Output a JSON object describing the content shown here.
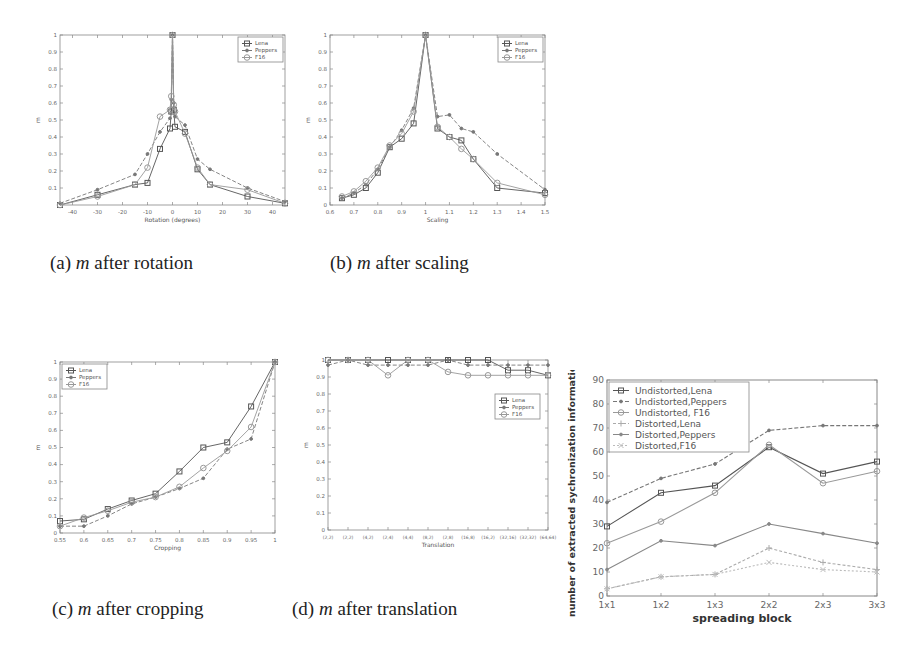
{
  "figure": {
    "captions": [
      {
        "label": "(a)",
        "var": "m",
        "text": "after rotation"
      },
      {
        "label": "(b)",
        "var": "m",
        "text": "after scaling"
      },
      {
        "label": "(c)",
        "var": "m",
        "text": "after cropping"
      },
      {
        "label": "(d)",
        "var": "m",
        "text": "after translation"
      }
    ]
  },
  "chart_data": [
    {
      "id": "rotation",
      "type": "line",
      "title": "",
      "xlabel": "Rotation (degrees)",
      "ylabel": "m",
      "xlim": [
        -45,
        45
      ],
      "ylim": [
        0,
        1
      ],
      "xticks": [
        -40,
        -30,
        -20,
        -10,
        0,
        10,
        20,
        30,
        40
      ],
      "yticks": [
        0.1,
        0.2,
        0.3,
        0.4,
        0.5,
        0.6,
        0.7,
        0.8,
        0.9,
        1
      ],
      "grid": false,
      "legend": {
        "position": "upper right",
        "entries": [
          "Lena",
          "Peppers",
          "F16"
        ]
      },
      "x": [
        -45,
        -30,
        -15,
        -10,
        -5,
        -1,
        -0.5,
        0,
        0.5,
        1,
        5,
        10,
        15,
        30,
        45
      ],
      "series": [
        {
          "name": "Lena",
          "marker": "square",
          "values": [
            0.0,
            0.06,
            0.12,
            0.13,
            0.33,
            0.45,
            0.55,
            1.0,
            0.56,
            0.46,
            0.43,
            0.21,
            0.12,
            0.05,
            0.01
          ]
        },
        {
          "name": "Peppers",
          "marker": "dot",
          "values": [
            0.01,
            0.09,
            0.18,
            0.3,
            0.43,
            0.51,
            0.62,
            1.0,
            0.6,
            0.52,
            0.47,
            0.27,
            0.21,
            0.1,
            0.02
          ]
        },
        {
          "name": "F16",
          "marker": "circle",
          "values": [
            0.0,
            0.05,
            0.12,
            0.22,
            0.52,
            0.56,
            0.64,
            1.0,
            0.59,
            0.55,
            0.42,
            0.22,
            0.12,
            0.09,
            0.01
          ]
        }
      ]
    },
    {
      "id": "scaling",
      "type": "line",
      "title": "",
      "xlabel": "Scaling",
      "ylabel": "m",
      "xlim": [
        0.6,
        1.5
      ],
      "ylim": [
        0,
        1
      ],
      "xticks": [
        0.6,
        0.7,
        0.8,
        0.9,
        1,
        1.1,
        1.2,
        1.3,
        1.4,
        1.5
      ],
      "xticklabels": [
        "0.6",
        "0.7",
        "0.8",
        "0.9",
        "1",
        "1.1",
        "1.2",
        "1.3",
        "1.4",
        "1.5"
      ],
      "yticks": [
        0,
        0.1,
        0.2,
        0.3,
        0.4,
        0.5,
        0.6,
        0.7,
        0.8,
        0.9,
        1
      ],
      "grid": false,
      "legend": {
        "position": "upper right",
        "entries": [
          "Lena",
          "Peppers",
          "F16"
        ]
      },
      "x": [
        0.65,
        0.7,
        0.75,
        0.8,
        0.85,
        0.9,
        0.95,
        1.0,
        1.05,
        1.1,
        1.15,
        1.2,
        1.3,
        1.5
      ],
      "series": [
        {
          "name": "Lena",
          "marker": "square",
          "values": [
            0.04,
            0.06,
            0.1,
            0.19,
            0.34,
            0.39,
            0.48,
            1.0,
            0.45,
            0.4,
            0.38,
            0.27,
            0.1,
            0.07
          ]
        },
        {
          "name": "Peppers",
          "marker": "dot",
          "values": [
            0.04,
            0.07,
            0.12,
            0.21,
            0.34,
            0.44,
            0.57,
            1.0,
            0.52,
            0.53,
            0.45,
            0.43,
            0.3,
            0.09
          ]
        },
        {
          "name": "F16",
          "marker": "circle",
          "values": [
            0.05,
            0.08,
            0.14,
            0.22,
            0.35,
            0.42,
            0.55,
            1.0,
            0.46,
            0.4,
            0.33,
            0.27,
            0.13,
            0.06
          ]
        }
      ]
    },
    {
      "id": "cropping",
      "type": "line",
      "title": "",
      "xlabel": "Cropping",
      "ylabel": "m",
      "xlim": [
        0.55,
        1
      ],
      "ylim": [
        0,
        1
      ],
      "xticks": [
        0.55,
        0.6,
        0.65,
        0.7,
        0.75,
        0.8,
        0.85,
        0.9,
        0.95,
        1
      ],
      "xticklabels": [
        "0.55",
        "0.6",
        "0.65",
        "0.7",
        "0.75",
        "0.8",
        "0.85",
        "0.9",
        "0.95",
        "1"
      ],
      "yticks": [
        0,
        0.1,
        0.2,
        0.3,
        0.4,
        0.5,
        0.6,
        0.7,
        0.8,
        0.9,
        1
      ],
      "grid": false,
      "legend": {
        "position": "upper left",
        "entries": [
          "Lena",
          "Peppers",
          "F16"
        ]
      },
      "x": [
        0.55,
        0.6,
        0.65,
        0.7,
        0.75,
        0.8,
        0.85,
        0.9,
        0.95,
        1.0
      ],
      "series": [
        {
          "name": "Lena",
          "marker": "square",
          "values": [
            0.07,
            0.08,
            0.14,
            0.19,
            0.23,
            0.36,
            0.5,
            0.53,
            0.74,
            1.0
          ]
        },
        {
          "name": "Peppers",
          "marker": "dot",
          "values": [
            0.04,
            0.04,
            0.1,
            0.17,
            0.21,
            0.26,
            0.32,
            0.49,
            0.55,
            1.0
          ]
        },
        {
          "name": "F16",
          "marker": "circle",
          "values": [
            0.04,
            0.09,
            0.13,
            0.18,
            0.21,
            0.27,
            0.38,
            0.48,
            0.62,
            1.0
          ]
        }
      ]
    },
    {
      "id": "translation",
      "type": "line",
      "title": "",
      "xlabel": "Translation",
      "ylabel": "m",
      "ylim": [
        0,
        1
      ],
      "yticks": [
        0,
        0.1,
        0.2,
        0.3,
        0.4,
        0.5,
        0.6,
        0.7,
        0.8,
        0.9,
        1
      ],
      "categories": [
        "(2,2)",
        "(2,2)",
        "(4,2)",
        "(2,4)",
        "(4,4)",
        "(8,2)",
        "(2,8)",
        "(16,8)",
        "(16,2)",
        "(32,16)",
        "(32,32)",
        "(64,64)"
      ],
      "grid": false,
      "legend": {
        "position": "upper right (inset)",
        "entries": [
          "Lena",
          "Peppers",
          "F16"
        ]
      },
      "series": [
        {
          "name": "Lena",
          "marker": "square",
          "values": [
            1.0,
            1.0,
            1.0,
            1.0,
            1.0,
            1.0,
            1.0,
            1.0,
            1.0,
            0.94,
            0.94,
            0.91
          ]
        },
        {
          "name": "Peppers",
          "marker": "dot",
          "values": [
            0.97,
            1.0,
            0.97,
            0.97,
            0.97,
            0.97,
            1.0,
            0.97,
            0.97,
            0.97,
            0.97,
            0.97
          ]
        },
        {
          "name": "F16",
          "marker": "circle",
          "values": [
            1.0,
            1.0,
            1.0,
            0.91,
            1.0,
            1.0,
            0.93,
            0.91,
            0.91,
            0.91,
            0.91,
            0.91
          ]
        }
      ]
    },
    {
      "id": "spreading",
      "type": "line",
      "title": "",
      "xlabel": "spreading block",
      "ylabel": "number of extracted sychronization information",
      "ylim": [
        0,
        90
      ],
      "yticks": [
        0,
        10,
        20,
        30,
        40,
        50,
        60,
        70,
        80,
        90
      ],
      "categories": [
        "1x1",
        "1x2",
        "1x3",
        "2x2",
        "2x3",
        "3x3"
      ],
      "grid": false,
      "legend": {
        "position": "upper left",
        "entries": [
          "Undistorted,Lena",
          "Undistorted,Peppers",
          "Undistorted, F16",
          "Distorted,Lena",
          "Distorted,Peppers",
          "Distorted,F16"
        ]
      },
      "series": [
        {
          "name": "Undistorted,Lena",
          "marker": "square",
          "values": [
            29,
            43,
            46,
            62,
            51,
            56
          ]
        },
        {
          "name": "Undistorted,Peppers",
          "marker": "dot",
          "values": [
            39,
            49,
            55,
            69,
            71,
            71
          ]
        },
        {
          "name": "Undistorted, F16",
          "marker": "circle",
          "values": [
            22,
            31,
            43,
            63,
            47,
            52
          ]
        },
        {
          "name": "Distorted,Lena",
          "marker": "plus",
          "values": [
            3,
            8,
            9,
            20,
            14,
            11
          ]
        },
        {
          "name": "Distorted,Peppers",
          "marker": "dot",
          "values": [
            11,
            23,
            21,
            30,
            26,
            22
          ]
        },
        {
          "name": "Distorted,F16",
          "marker": "x",
          "values": [
            3,
            8,
            9,
            14,
            11,
            10
          ]
        }
      ]
    }
  ]
}
